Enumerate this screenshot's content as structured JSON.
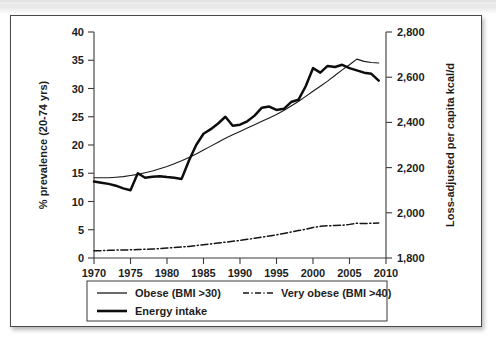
{
  "figure": {
    "background_color": "#ffffff",
    "border_color": "#4a4a4a",
    "scan_band_color": "#e8e8e8"
  },
  "chart_data": {
    "type": "line",
    "title": "",
    "subtitle": "",
    "xlabel": "",
    "ylabel": "% prevalence (20-74 yrs)",
    "y2label": "Loss-adjusted per capita kcal/d",
    "xlim": [
      1970,
      2010
    ],
    "ylim": [
      0,
      40
    ],
    "y2lim": [
      1800,
      2800
    ],
    "grid": false,
    "legend_position": "below-plot",
    "x_ticks": [
      1970,
      1975,
      1980,
      1985,
      1990,
      1995,
      2000,
      2005,
      2010
    ],
    "x_tick_labels": [
      "1970",
      "1975",
      "1980",
      "1985",
      "1990",
      "1995",
      "2000",
      "2005",
      "2010"
    ],
    "y_ticks": [
      0,
      5,
      10,
      15,
      20,
      25,
      30,
      35,
      40
    ],
    "y_tick_labels": [
      "0",
      "5",
      "10",
      "15",
      "20",
      "25",
      "30",
      "35",
      "40"
    ],
    "y2_ticks": [
      1800,
      2000,
      2200,
      2400,
      2600,
      2800
    ],
    "y2_tick_labels": [
      "1,800",
      "2,000",
      "2,200",
      "2,400",
      "2,600",
      "2,800"
    ],
    "series": [
      {
        "name": "Obese (BMI >30)",
        "axis": "left",
        "style": "solid-thin",
        "color": "#1a1a1a",
        "x": [
          1970,
          1971,
          1972,
          1973,
          1974,
          1975,
          1976,
          1977,
          1978,
          1979,
          1980,
          1981,
          1982,
          1983,
          1984,
          1985,
          1986,
          1987,
          1988,
          1989,
          1990,
          1991,
          1992,
          1993,
          1994,
          1995,
          1996,
          1997,
          1998,
          1999,
          2000,
          2001,
          2002,
          2003,
          2004,
          2005,
          2006,
          2007,
          2008,
          2009
        ],
        "values": [
          14.2,
          14.2,
          14.2,
          14.3,
          14.4,
          14.6,
          14.8,
          15.1,
          15.4,
          15.8,
          16.2,
          16.7,
          17.2,
          17.8,
          18.4,
          19.1,
          19.8,
          20.5,
          21.2,
          21.8,
          22.4,
          23.0,
          23.6,
          24.2,
          24.8,
          25.4,
          26.1,
          26.9,
          27.7,
          28.6,
          29.5,
          30.4,
          31.3,
          32.3,
          33.3,
          34.2,
          35.2,
          34.8,
          34.6,
          34.5
        ]
      },
      {
        "name": "Energy intake",
        "axis": "right",
        "style": "solid-thick",
        "color": "#0d0d0d",
        "x": [
          1970,
          1971,
          1972,
          1973,
          1974,
          1975,
          1976,
          1977,
          1978,
          1979,
          1980,
          1981,
          1982,
          1983,
          1984,
          1985,
          1986,
          1987,
          1988,
          1989,
          1990,
          1991,
          1992,
          1993,
          1994,
          1995,
          1996,
          1997,
          1998,
          1999,
          2000,
          2001,
          2002,
          2003,
          2004,
          2005,
          2006,
          2007,
          2008,
          2009
        ],
        "values": [
          2138,
          2133,
          2128,
          2120,
          2108,
          2100,
          2175,
          2155,
          2160,
          2162,
          2158,
          2155,
          2150,
          2230,
          2300,
          2350,
          2370,
          2395,
          2425,
          2385,
          2390,
          2405,
          2430,
          2465,
          2470,
          2455,
          2460,
          2490,
          2500,
          2560,
          2640,
          2620,
          2650,
          2645,
          2655,
          2640,
          2630,
          2620,
          2615,
          2585
        ],
        "values_left_axis_equivalent": [
          13.5,
          13.3,
          13.1,
          12.8,
          12.4,
          12.0,
          15.0,
          14.2,
          14.4,
          14.5,
          14.3,
          14.2,
          14.0,
          17.2,
          20.0,
          22.0,
          22.8,
          23.8,
          25.0,
          23.4,
          23.6,
          24.2,
          25.2,
          26.6,
          26.8,
          26.2,
          26.4,
          27.6,
          28.0,
          30.4,
          33.6,
          32.8,
          34.0,
          33.8,
          34.2,
          33.6,
          33.2,
          32.8,
          32.6,
          31.4
        ]
      },
      {
        "name": "Very obese (BMI >40)",
        "axis": "left",
        "style": "dash-dot",
        "color": "#151515",
        "x": [
          1970,
          1971,
          1972,
          1973,
          1974,
          1975,
          1976,
          1977,
          1978,
          1979,
          1980,
          1981,
          1982,
          1983,
          1984,
          1985,
          1986,
          1987,
          1988,
          1989,
          1990,
          1991,
          1992,
          1993,
          1994,
          1995,
          1996,
          1997,
          1998,
          1999,
          2000,
          2001,
          2002,
          2003,
          2004,
          2005,
          2006,
          2007,
          2008,
          2009
        ],
        "values": [
          1.3,
          1.3,
          1.35,
          1.4,
          1.4,
          1.45,
          1.5,
          1.55,
          1.6,
          1.65,
          1.75,
          1.85,
          1.95,
          2.05,
          2.2,
          2.35,
          2.5,
          2.65,
          2.8,
          2.95,
          3.1,
          3.3,
          3.5,
          3.7,
          3.9,
          4.1,
          4.35,
          4.6,
          4.85,
          5.1,
          5.4,
          5.6,
          5.7,
          5.75,
          5.8,
          5.95,
          6.15,
          6.1,
          6.15,
          6.2
        ]
      }
    ],
    "annotations": []
  },
  "legend": {
    "entries": [
      {
        "label": "Obese (BMI >30)",
        "style": "solid-thin"
      },
      {
        "label": "Very obese (BMI >40)",
        "style": "dash-dot"
      },
      {
        "label": "Energy intake",
        "style": "solid-thick"
      }
    ]
  }
}
